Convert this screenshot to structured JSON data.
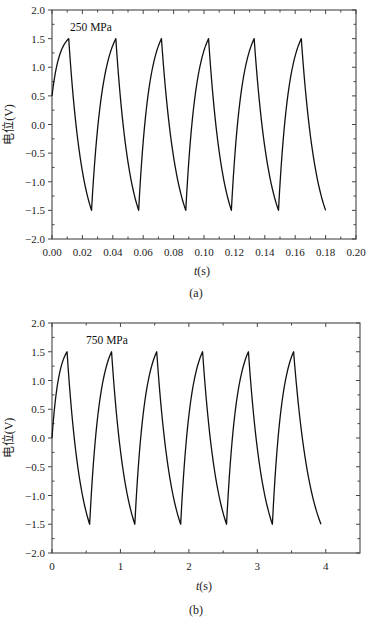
{
  "chart_data": [
    {
      "id": "a",
      "type": "line",
      "caption": "(a)",
      "annotation": "250 MPa",
      "xlabel": "t(s)",
      "xlabel_italic": "t",
      "xlabel_unit": "(s)",
      "ylabel": "电位(V)",
      "xlim": [
        0.0,
        0.2
      ],
      "ylim": [
        -2.0,
        2.0
      ],
      "xticks": [
        "0.00",
        "0.02",
        "0.04",
        "0.06",
        "0.08",
        "0.10",
        "0.12",
        "0.14",
        "0.16",
        "0.18",
        "0.20"
      ],
      "xtick_values": [
        0.0,
        0.02,
        0.04,
        0.06,
        0.08,
        0.1,
        0.12,
        0.14,
        0.16,
        0.18,
        0.2
      ],
      "yticks": [
        "2.0",
        "1.5",
        "1.0",
        "0.5",
        "0.0",
        "-0.5",
        "-1.0",
        "-1.5",
        "-2.0"
      ],
      "ytick_values": [
        2.0,
        1.5,
        1.0,
        0.5,
        0.0,
        -0.5,
        -1.0,
        -1.5,
        -2.0
      ],
      "grid": false,
      "legend": null,
      "series": [
        {
          "name": "potential",
          "start": {
            "t": 0.0,
            "v": 0.5
          },
          "peaks_t": [
            0.011,
            0.042,
            0.072,
            0.103,
            0.133,
            0.164
          ],
          "troughs_t": [
            0.026,
            0.057,
            0.088,
            0.118,
            0.149
          ],
          "end": {
            "t": 0.18,
            "v": -1.5
          },
          "peak_v": 1.5,
          "trough_v": -1.5
        }
      ]
    },
    {
      "id": "b",
      "type": "line",
      "caption": "(b)",
      "annotation": "750 MPa",
      "xlabel": "t(s)",
      "xlabel_italic": "t",
      "xlabel_unit": "(s)",
      "ylabel": "电位(V)",
      "xlim": [
        0,
        4.5
      ],
      "ylim": [
        -2.0,
        2.0
      ],
      "xticks": [
        "0",
        "1",
        "2",
        "3",
        "4"
      ],
      "xtick_values": [
        0,
        1,
        2,
        3,
        4
      ],
      "yticks": [
        "2.0",
        "1.5",
        "1.0",
        "0.5",
        "0.0",
        "-0.5",
        "-1.0",
        "-1.5",
        "-2.0"
      ],
      "ytick_values": [
        2.0,
        1.5,
        1.0,
        0.5,
        0.0,
        -0.5,
        -1.0,
        -1.5,
        -2.0
      ],
      "grid": false,
      "legend": null,
      "series": [
        {
          "name": "potential",
          "start": {
            "t": 0.0,
            "v": 0.0
          },
          "peaks_t": [
            0.22,
            0.87,
            1.53,
            2.2,
            2.87,
            3.53
          ],
          "troughs_t": [
            0.55,
            1.21,
            1.88,
            2.55,
            3.22
          ],
          "end": {
            "t": 3.93,
            "v": -1.5
          },
          "peak_v": 1.5,
          "trough_v": -1.5
        }
      ]
    }
  ]
}
